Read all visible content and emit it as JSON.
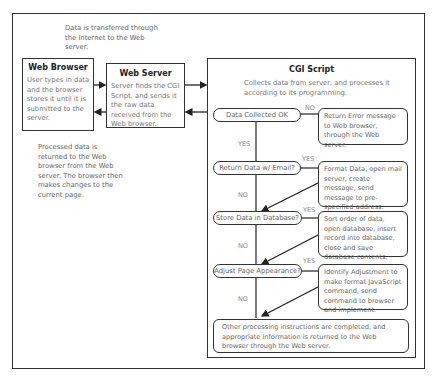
{
  "notes": {
    "transfer": "Data is transferred through the Internet to the Web server.",
    "returned": "Processed data is returned to the Web browser from the Web server. The browser then makes changes to the current page."
  },
  "web_browser": {
    "title": "Web Browser",
    "text": "User types in data and the browser stores it until it is submitted to the server."
  },
  "web_server": {
    "title": "Web Server",
    "text": "Server finds the CGI Script, and sends it the raw data received from the Web browser."
  },
  "cgi": {
    "title": "CGI Script",
    "intro": "Collects data from server, and processes it according to its programming.",
    "decisions": [
      {
        "label": "Data Collected OK",
        "branch_label": "NO",
        "down_label": "YES",
        "action": "Return Error message to Web browser, through the Web server."
      },
      {
        "label": "Return Data w/ Email?",
        "branch_label": "YES",
        "down_label": "NO",
        "action": "Format Data, open mail server, create message, send message to pre-specified address."
      },
      {
        "label": "Store Data in Database?",
        "branch_label": "YES",
        "down_label": "NO",
        "action": "Sort order of data, open database, insert record into database, close and save database contents."
      },
      {
        "label": "Adjust Page Appearance?",
        "branch_label": "YES",
        "down_label": "NO",
        "action": "Identify Adjustment to make format JavaScript command, send command to browser and implement."
      }
    ],
    "final": "Other processing instructions are completed, and appropriate information is returned to the Web browser through the Web server."
  }
}
